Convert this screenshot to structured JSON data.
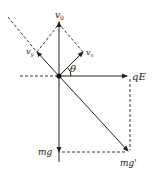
{
  "diagram": {
    "type": "force-velocity vector diagram",
    "labels": {
      "v0": "v",
      "v0_sub": "0",
      "vy": "v",
      "vy_sub": "y",
      "vx": "v",
      "vx_sub": "x",
      "theta": "θ",
      "qE": "qE",
      "mg": "mg",
      "mg_prime": "mg'"
    },
    "colors": {
      "stroke": "#222222",
      "background": "#ffffff"
    }
  }
}
